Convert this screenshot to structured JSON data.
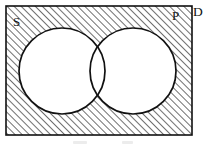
{
  "figure": {
    "type": "venn-diagram",
    "background_color": "#ffffff",
    "stroke_color": "#111111",
    "hatch_color": "#1a1a1a",
    "circle_fill": "#ffffff",
    "canvas": {
      "width": 203,
      "height": 145
    }
  },
  "labels": {
    "left_set": "S",
    "right_set": "P",
    "universal_set": "D"
  },
  "regions": {
    "rectangle": {
      "name": "universal-set-rectangle",
      "x": 6,
      "y": 6,
      "width": 186,
      "height": 129,
      "shaded": true,
      "shading": "diagonal-hatch"
    },
    "left_circle": {
      "name": "set-s-circle",
      "cx": 62,
      "cy": 71,
      "r": 43,
      "shaded": false
    },
    "right_circle": {
      "name": "set-p-circle",
      "cx": 133,
      "cy": 71,
      "r": 43,
      "shaded": false
    },
    "intersection": {
      "name": "s-intersect-p-lens",
      "shaded": false
    }
  },
  "label_positions": {
    "left_set": {
      "x": 13,
      "y": 26
    },
    "right_set": {
      "x": 172,
      "y": 20
    },
    "universal_set": {
      "x": 193,
      "y": 16
    }
  }
}
